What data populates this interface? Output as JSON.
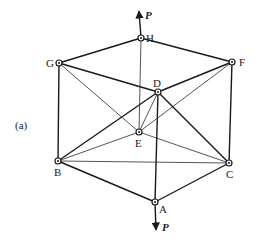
{
  "figure": {
    "label": "(a)",
    "load_label": "P",
    "nodes": [
      {
        "id": "H",
        "x": 141,
        "y": 38,
        "label": "H"
      },
      {
        "id": "G",
        "x": 59,
        "y": 63,
        "label": "G"
      },
      {
        "id": "F",
        "x": 232,
        "y": 62,
        "label": "F"
      },
      {
        "id": "D",
        "x": 158,
        "y": 92,
        "label": "D"
      },
      {
        "id": "E",
        "x": 139,
        "y": 132,
        "label": "E"
      },
      {
        "id": "B",
        "x": 58,
        "y": 161,
        "label": "B"
      },
      {
        "id": "C",
        "x": 229,
        "y": 163,
        "label": "C"
      },
      {
        "id": "A",
        "x": 155,
        "y": 202,
        "label": "A"
      }
    ],
    "members": [
      [
        "G",
        "H"
      ],
      [
        "H",
        "F"
      ],
      [
        "G",
        "D"
      ],
      [
        "D",
        "F"
      ],
      [
        "G",
        "B"
      ],
      [
        "F",
        "C"
      ],
      [
        "B",
        "A"
      ],
      [
        "A",
        "C"
      ],
      [
        "B",
        "D"
      ],
      [
        "D",
        "C"
      ],
      [
        "D",
        "A"
      ],
      [
        "B",
        "C"
      ],
      [
        "H",
        "E"
      ],
      [
        "G",
        "E"
      ],
      [
        "E",
        "F"
      ],
      [
        "B",
        "E"
      ],
      [
        "E",
        "C"
      ],
      [
        "D",
        "E"
      ]
    ],
    "loads": [
      {
        "at": "H",
        "direction": "up",
        "label": "P"
      },
      {
        "at": "A",
        "direction": "down",
        "label": "P"
      }
    ]
  }
}
